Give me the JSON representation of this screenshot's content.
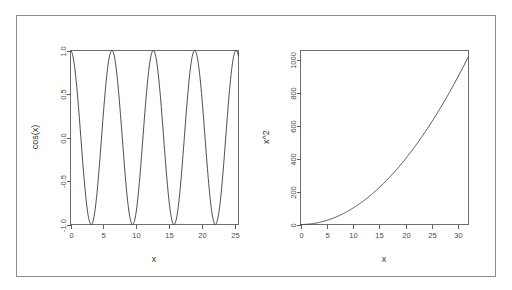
{
  "figure": {
    "background_color": "#ffffff",
    "frame_color": "#8b8b8b",
    "axis_color": "#5b5b5b",
    "curve_color": "#3a3a3a",
    "panel_layout": "1 row x 2 columns"
  },
  "chart_data": [
    {
      "type": "line",
      "panel": "left",
      "title": "",
      "xlabel": "x",
      "ylabel": "cos(x)",
      "xlim": [
        0,
        25.5
      ],
      "ylim": [
        -1,
        1
      ],
      "xticks": [
        0,
        5,
        10,
        15,
        20,
        25
      ],
      "xticklabels": [
        "0",
        "5",
        "10",
        "15",
        "20",
        "25"
      ],
      "yticks": [
        -1.0,
        -0.5,
        0.0,
        0.5,
        1.0
      ],
      "yticklabels": [
        "-1.0",
        "-0.5",
        "0.0",
        "0.5",
        "1.0"
      ],
      "grid": false,
      "legend": null,
      "series": [
        {
          "name": "cos(x)",
          "function": "cos",
          "x_start": 0,
          "x_end": 25.5,
          "samples": 400,
          "points_note": "y = cos(x); peaks at x = 0, 6.28, 12.57, 18.85, 25.13; troughs at x = 3.14, 9.42, 15.71, 21.99"
        }
      ]
    },
    {
      "type": "line",
      "panel": "right",
      "title": "",
      "xlabel": "x",
      "ylabel": "x^2",
      "xlim": [
        0,
        32
      ],
      "ylim": [
        0,
        1060
      ],
      "xticks": [
        0,
        5,
        10,
        15,
        20,
        25,
        30
      ],
      "xticklabels": [
        "0",
        "5",
        "10",
        "15",
        "20",
        "25",
        "30"
      ],
      "yticks": [
        0,
        200,
        400,
        600,
        800,
        1000
      ],
      "yticklabels": [
        "0",
        "200",
        "400",
        "600",
        "800",
        "1000"
      ],
      "grid": false,
      "legend": null,
      "series": [
        {
          "name": "x^2",
          "function": "square",
          "x_start": 0,
          "x_end": 32,
          "samples": 300,
          "points_note": "y = x^2; (0,0) (5,25) (10,100) (15,225) (20,400) (25,625) (30,900) (32,1024)"
        }
      ]
    }
  ]
}
